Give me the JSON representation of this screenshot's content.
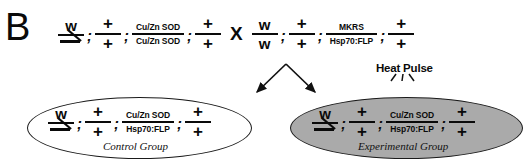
{
  "figure": {
    "panel_label": "B",
    "cross_symbol": "X",
    "separator": ";"
  },
  "parents": [
    {
      "name": "parent-left",
      "loci": [
        {
          "top": "w",
          "bottom": "Y-chromosome",
          "top_kind": "letter",
          "bottom_kind": "ychrom"
        },
        {
          "top": "+",
          "bottom": "+",
          "top_kind": "plus",
          "bottom_kind": "plus"
        },
        {
          "top": "Cu/Zn SOD",
          "bottom": "Cu/Zn SOD",
          "top_kind": "gene",
          "bottom_kind": "gene"
        },
        {
          "top": "+",
          "bottom": "+",
          "top_kind": "plus",
          "bottom_kind": "plus"
        }
      ]
    },
    {
      "name": "parent-right",
      "loci": [
        {
          "top": "w",
          "bottom": "w",
          "top_kind": "letter",
          "bottom_kind": "letter"
        },
        {
          "top": "+",
          "bottom": "+",
          "top_kind": "plus",
          "bottom_kind": "plus"
        },
        {
          "top": "MKRS",
          "bottom": "Hsp70:FLP",
          "top_kind": "gene",
          "bottom_kind": "gene"
        },
        {
          "top": "+",
          "bottom": "+",
          "top_kind": "plus",
          "bottom_kind": "plus"
        }
      ]
    }
  ],
  "offspring": [
    {
      "name": "control-group",
      "caption": "Control Group",
      "fill": "#ffffff",
      "loci": [
        {
          "top": "w",
          "bottom": "Y-chromosome",
          "top_kind": "letter",
          "bottom_kind": "ychrom"
        },
        {
          "top": "+",
          "bottom": "+",
          "top_kind": "plus",
          "bottom_kind": "plus"
        },
        {
          "top": "Cu/Zn SOD",
          "bottom": "Hsp70:FLP",
          "top_kind": "gene",
          "bottom_kind": "gene"
        },
        {
          "top": "+",
          "bottom": "+",
          "top_kind": "plus",
          "bottom_kind": "plus"
        }
      ]
    },
    {
      "name": "experimental-group",
      "caption": "Experimental Group",
      "fill": "#aaaaaa",
      "loci": [
        {
          "top": "w",
          "bottom": "Y-chromosome",
          "top_kind": "letter",
          "bottom_kind": "ychrom"
        },
        {
          "top": "+",
          "bottom": "+",
          "top_kind": "plus",
          "bottom_kind": "plus"
        },
        {
          "top": "Cu/Zn SOD",
          "bottom": "Hsp70:FLP",
          "top_kind": "gene",
          "bottom_kind": "gene"
        },
        {
          "top": "+",
          "bottom": "+",
          "top_kind": "plus",
          "bottom_kind": "plus"
        }
      ]
    }
  ],
  "annotations": {
    "heat_pulse_label": "Heat Pulse"
  },
  "colors": {
    "ink": "#0a0a0a",
    "experimental_fill": "#aaaaaa",
    "control_fill": "#ffffff"
  }
}
